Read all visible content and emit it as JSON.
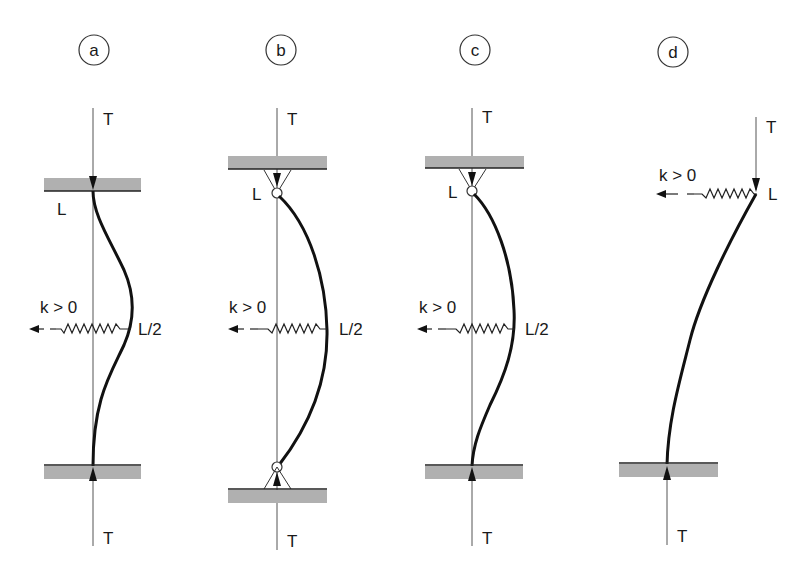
{
  "figure": {
    "panels": [
      {
        "id": "a",
        "label": "a",
        "top_force": "T",
        "bottom_force": "T",
        "top_point": "L",
        "spring_label": "k > 0",
        "spring_position": "L/2",
        "supports": "clamped-clamped"
      },
      {
        "id": "b",
        "label": "b",
        "top_force": "T",
        "bottom_force": "T",
        "top_point": "L",
        "spring_label": "k > 0",
        "spring_position": "L/2",
        "supports": "pinned-pinned"
      },
      {
        "id": "c",
        "label": "c",
        "top_force": "T",
        "bottom_force": "T",
        "top_point": "L",
        "spring_label": "k > 0",
        "spring_position": "L/2",
        "supports": "pinned-clamped"
      },
      {
        "id": "d",
        "label": "d",
        "top_force": "T",
        "bottom_force": "T",
        "top_point": "L",
        "spring_label": "k > 0",
        "supports": "free-clamped"
      }
    ]
  }
}
